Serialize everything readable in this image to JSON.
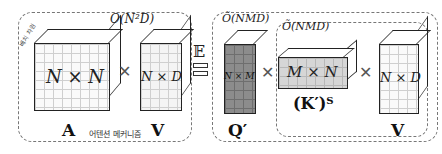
{
  "left_group": {
    "complexity": "O(N²D)",
    "caption": "어텐션 메커니즘",
    "batch_label": "배치 차원",
    "matrix_a": {
      "dims": "N × N",
      "name": "A"
    },
    "matrix_v": {
      "dims": "N × D",
      "name": "V"
    }
  },
  "equiv_symbol": "𝔼",
  "right_group": {
    "complexity_outer": "Õ(NMD)",
    "complexity_inner": "Õ(NMD)",
    "matrix_q": {
      "dims": "N × M",
      "name": "Q′"
    },
    "matrix_k": {
      "dims": "M × N",
      "name": "(K′)ᵀ"
    },
    "matrix_v": {
      "dims": "N × D",
      "name": "V"
    }
  },
  "operator": "✕"
}
